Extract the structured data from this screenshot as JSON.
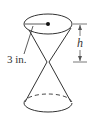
{
  "diagram": {
    "type": "double-cone",
    "radius_label": "3 in.",
    "height_label": "h",
    "stroke_color": "#333333",
    "background_color": "#ffffff"
  }
}
